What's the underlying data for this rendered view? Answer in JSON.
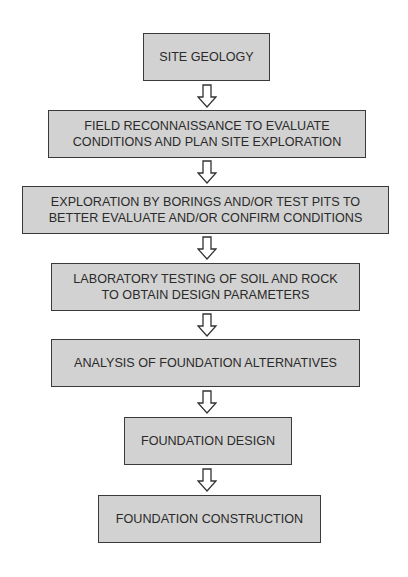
{
  "diagram": {
    "type": "flowchart",
    "steps": [
      {
        "label": "SITE GEOLOGY"
      },
      {
        "label": "FIELD RECONNAISSANCE TO EVALUATE\nCONDITIONS AND PLAN SITE EXPLORATION"
      },
      {
        "label": "EXPLORATION BY BORINGS AND/OR TEST PITS TO\nBETTER EVALUATE AND/OR CONFIRM CONDITIONS"
      },
      {
        "label": "LABORATORY TESTING OF SOIL AND ROCK\nTO OBTAIN DESIGN PARAMETERS"
      },
      {
        "label": "ANALYSIS OF FOUNDATION ALTERNATIVES"
      },
      {
        "label": "FOUNDATION DESIGN"
      },
      {
        "label": "FOUNDATION CONSTRUCTION"
      }
    ],
    "connector_icon": "down-arrow-outline-icon",
    "colors": {
      "box_fill": "#d2d2d2",
      "box_border": "#3a3a3a",
      "text": "#2a2a2a"
    }
  }
}
